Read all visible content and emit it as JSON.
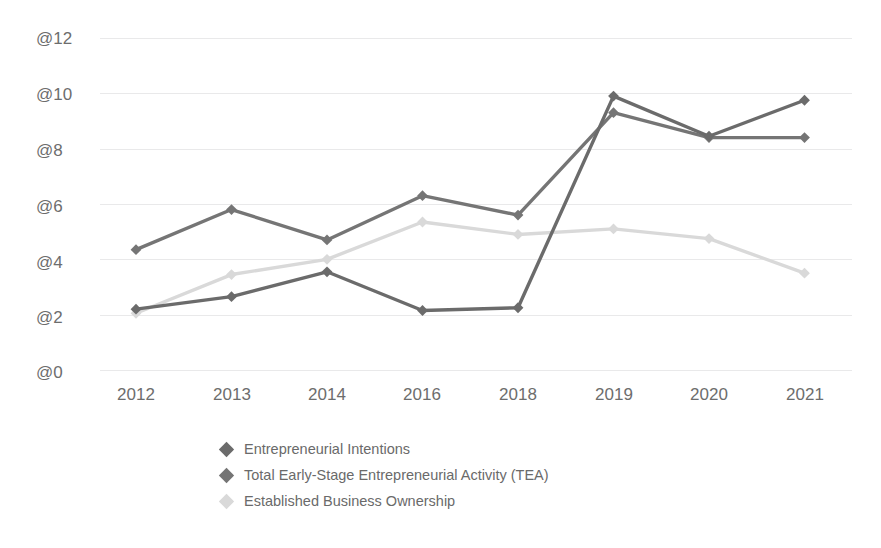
{
  "chart_data": {
    "type": "line",
    "title": "",
    "subtitle": "",
    "xlabel": "",
    "ylabel": "",
    "grid": true,
    "legend_position": "bottom",
    "categories": [
      "2012",
      "2013",
      "2014",
      "2016",
      "2018",
      "2019",
      "2020",
      "2021"
    ],
    "ytick_labels": [
      "@12",
      "@10",
      "@8",
      "@6",
      "@4",
      "@2",
      "@0"
    ],
    "ytick_values": [
      12,
      10,
      8,
      6,
      4,
      2,
      0
    ],
    "ylim": [
      0,
      12
    ],
    "series": [
      {
        "name": "Entrepreneurial Intentions",
        "color": "#6b6b6b",
        "values": [
          2.2,
          2.65,
          3.55,
          2.15,
          2.25,
          9.9,
          8.45,
          9.75
        ]
      },
      {
        "name": "Total Early-Stage Entrepreneurial Activity (TEA)",
        "color": "#757575",
        "values": [
          4.35,
          5.8,
          4.7,
          6.3,
          5.6,
          9.3,
          8.4,
          8.4
        ]
      },
      {
        "name": "Established Business Ownership",
        "color": "#d9d9d9",
        "values": [
          2.05,
          3.45,
          4.0,
          5.35,
          4.9,
          5.1,
          4.75,
          3.5
        ]
      }
    ]
  },
  "axis": {
    "y_labels": [
      "@12",
      "@10",
      "@8",
      "@6",
      "@4",
      "@2",
      "@0"
    ],
    "x_labels": [
      "2012",
      "2013",
      "2014",
      "2016",
      "2018",
      "2019",
      "2020",
      "2021"
    ]
  },
  "legend": {
    "items": [
      {
        "label": "Entrepreneurial Intentions",
        "marker": "diamond-marker",
        "color": "#6b6b6b"
      },
      {
        "label": "Total Early-Stage Entrepreneurial Activity (TEA)",
        "marker": "diamond-marker",
        "color": "#757575"
      },
      {
        "label": "Established Business Ownership",
        "marker": "diamond-marker",
        "color": "#d9d9d9"
      }
    ]
  },
  "style": {
    "background": "#ffffff",
    "gridline_color": "#e9e9ea",
    "tick_label_color": "#6d6d6d",
    "legend_text_color": "#6a6a6a"
  }
}
